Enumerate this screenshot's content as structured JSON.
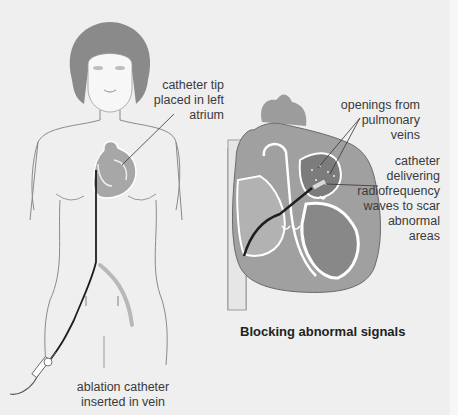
{
  "figure": {
    "title": "Blocking abnormal signals",
    "labels": {
      "catheter_tip": "catheter tip\nplaced in left\natrium",
      "pulmonary_openings": "openings from\npulmonary\nveins",
      "catheter_rf": "catheter\ndelivering\nradiofrequency\nwaves to scar\nabnormal\nareas",
      "ablation_catheter": "ablation catheter\ninserted in vein"
    },
    "colors": {
      "background": "#efefef",
      "skin_outline": "#8a8a8a",
      "hair": "#7a7a7a",
      "heart_fill": "#9c9c9c",
      "chamber_dark": "#7c7c7c",
      "catheter": "#1e1e1e",
      "vein": "#b8b8b8"
    }
  }
}
